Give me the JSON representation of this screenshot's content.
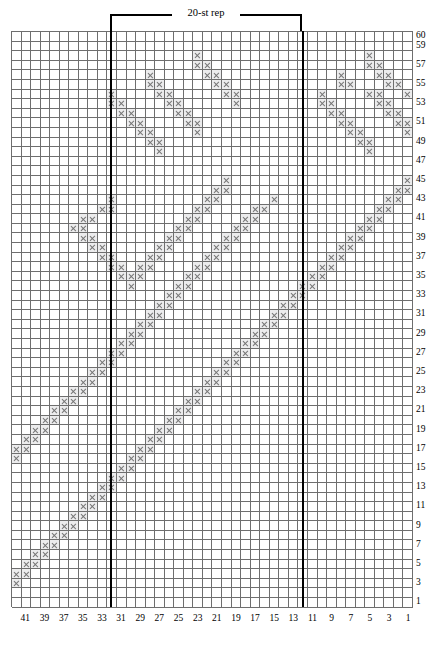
{
  "chart_data": {
    "type": "heatmap",
    "repeat_label": "20-st rep",
    "repeat_start_col": 31,
    "repeat_end_col": 12,
    "repeat_width": 20,
    "columns": 42,
    "rows": 60,
    "column_order": "right-to-left",
    "row_order": "bottom-to-top",
    "xlabel": "",
    "ylabel": "",
    "column_labels": [
      41,
      39,
      37,
      35,
      33,
      31,
      29,
      27,
      25,
      23,
      21,
      19,
      17,
      15,
      13,
      11,
      9,
      7,
      5,
      3,
      1
    ],
    "row_labels": [
      60,
      59,
      57,
      55,
      53,
      51,
      49,
      47,
      45,
      43,
      41,
      39,
      37,
      35,
      33,
      31,
      29,
      27,
      25,
      23,
      21,
      19,
      17,
      15,
      13,
      11,
      9,
      7,
      5,
      3,
      1
    ],
    "symbol": "x",
    "symbol_meaning": "purl / contrast stitch",
    "cell_on_color": "#ececed",
    "cell_symbol_color": "#767676",
    "grid_line_color": "#6e6e6e",
    "rep_line_color": "#000000",
    "grid": [
      "000000000000000000000000000000000000000000",
      "000000000000000000000000000000000000000000",
      "000000000000000000010000000000000000010000",
      "000000000000000000011000000000000000011000",
      "000000000000001000001100000000000010001100",
      "000000000000001100000110000000000011000110",
      "000000000010000110000011000000001000011001",
      "000000000011000011000001000000001100001100",
      "000000000001100001100000000000000110000110",
      "000000000000110000110000000000000011000011",
      "000000000000011000010000000000000001100001",
      "000000000000001100000000000000000000110000",
      "000000000000000100000000000000000000010000",
      "000000000000000000000000000000000000000000",
      "000000000000000000000000000000000000000000",
      "000000000000000000000010000000000000000001",
      "000000000000000000000110000000000000000011",
      "000000000010000000001100000100000000000110",
      "000000000110000000011000011000000000001100",
      "000000011000000000110000110000000000011000",
      "000000110000000001100001100000000000110000",
      "000000011000000011000011000000000001100000",
      "000000001100000110000110000000000011000000",
      "000000000110001100001100000000000110000000",
      "000000000011011000011000000000001100000000",
      "000000000001110000110000000000011000000000",
      "000000000000100001100000000000110000000000",
      "000000000000000011000000000001100000000000",
      "000000000000000110000000000011000000000000",
      "000000000000001100000000000110000000000000",
      "000000000000011000000000001100000000000000",
      "000000000000110000000000011000000000000000",
      "000000000001100000000000110000000000000000",
      "000000000011000000000001100000000000000000",
      "000000000110000000000011000000000000000000",
      "000000001100000000000110000000000000000000",
      "000000011000000000001100000000000000000000",
      "000000110000000000011000000000000000000000",
      "000001100000000000110000000000000000000000",
      "000011000000000001100000000000000000000000",
      "000110000000000011000000000000000000000000",
      "001100000000000110000000000000000000000000",
      "011000000000001100000000000000000000000000",
      "110000000000011000000000000000000000000000",
      "100000000000110000000000000000000000000000",
      "000000000001100000000000000000000000000000",
      "000000000011000000000000000000000000000000",
      "000000000110000000000000000000000000000000",
      "000000001100000000000000000000000000000000",
      "000000011000000000000000000000000000000000",
      "000000110000000000000000000000000000000000",
      "000001100000000000000000000000000000000000",
      "000011000000000000000000000000000000000000",
      "000110000000000000000000000000000000000000",
      "001100000000000000000000000000000000000000",
      "011000000000000000000000000000000000000000",
      "110000000000000000000000000000000000000000",
      "100000000000000000000000000000000000000000",
      "000000000000000000000000000000000000000000",
      "000000000000000000000000000000000000000000"
    ]
  }
}
